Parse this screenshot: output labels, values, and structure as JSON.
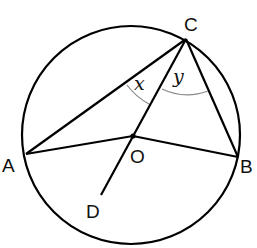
{
  "diagram": {
    "type": "circle-geometry",
    "circle": {
      "center_label": "O",
      "cx": 131,
      "cy": 135,
      "r": 109
    },
    "points": {
      "A": {
        "label": "A",
        "x": 26,
        "y": 154,
        "lx": 2,
        "ly": 172
      },
      "B": {
        "label": "B",
        "x": 238,
        "y": 157,
        "lx": 240,
        "ly": 173
      },
      "C": {
        "label": "C",
        "x": 186,
        "y": 39,
        "lx": 184,
        "ly": 31
      },
      "O": {
        "label": "O",
        "x": 133,
        "y": 136,
        "lx": 130,
        "ly": 163
      },
      "D": {
        "label": "D",
        "x": 101,
        "y": 195,
        "lx": 86,
        "ly": 218
      }
    },
    "segments": [
      "AC",
      "CB",
      "AO",
      "OB",
      "CD"
    ],
    "angles": [
      {
        "label": "x",
        "between": "AC and CO",
        "lx": 134,
        "ly": 90
      },
      {
        "label": "y",
        "between": "CO and CB",
        "lx": 173,
        "ly": 83
      }
    ],
    "colors": {
      "line": "#000000",
      "arc": "#8a8a8a",
      "text": "#111111"
    }
  }
}
